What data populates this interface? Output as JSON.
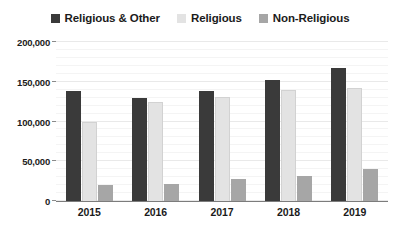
{
  "legend": {
    "position": "top-center",
    "entries": [
      {
        "label": "Religious & Other",
        "color": "#3a3a3a",
        "icon": "square-swatch-icon"
      },
      {
        "label": "Religious",
        "color": "#e3e3e3",
        "icon": "square-swatch-icon"
      },
      {
        "label": "Non-Religious",
        "color": "#a6a6a6",
        "icon": "square-swatch-icon"
      }
    ]
  },
  "axes": {
    "y_ticks": [
      "200,000",
      "150,000",
      "100,000",
      "50,000",
      "0"
    ],
    "x_ticks": [
      "2015",
      "2016",
      "2017",
      "2018",
      "2019"
    ]
  },
  "chart_data": {
    "type": "bar",
    "title": "",
    "subtitle": "",
    "xlabel": "",
    "ylabel": "",
    "categories": [
      "2015",
      "2016",
      "2017",
      "2018",
      "2019"
    ],
    "series": [
      {
        "name": "Religious & Other",
        "color": "#3a3a3a",
        "values": [
          138000,
          130000,
          139000,
          152000,
          167000
        ]
      },
      {
        "name": "Religious",
        "color": "#e3e3e3",
        "values": [
          100000,
          124000,
          131000,
          140000,
          142000
        ]
      },
      {
        "name": "Non-Religious",
        "color": "#a6a6a6",
        "values": [
          20000,
          22000,
          28000,
          32000,
          40000
        ]
      }
    ],
    "ylim": [
      0,
      200000
    ],
    "ytick_values": [
      0,
      50000,
      100000,
      150000,
      200000
    ],
    "ytick_labels": [
      "0",
      "50,000",
      "100,000",
      "150,000",
      "200,000"
    ],
    "grid": true,
    "grid_minor": true,
    "legend_position": "top-center",
    "bar_group_gap": true
  }
}
